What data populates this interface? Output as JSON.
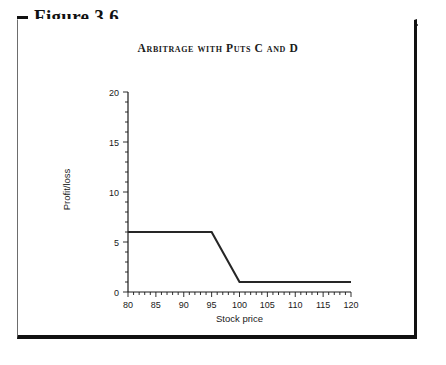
{
  "figure": {
    "bullet_icon": "black-square-bullet",
    "label": "Figure 3.6"
  },
  "chart_data": {
    "type": "line",
    "title": "Arbitrage with Puts C and D",
    "xlabel": "Stock price",
    "ylabel": "Profit/loss",
    "xlim": [
      80,
      120
    ],
    "ylim": [
      0,
      20
    ],
    "xticks": [
      80,
      85,
      90,
      95,
      100,
      105,
      110,
      115,
      120
    ],
    "xtick_labels": [
      "80",
      "85",
      "90",
      "95",
      "100",
      "105",
      "110",
      "115",
      "120"
    ],
    "yticks": [
      0,
      5,
      10,
      15,
      20
    ],
    "ytick_labels": [
      "0",
      "5",
      "10",
      "15",
      "20"
    ],
    "x_minor_step": 1,
    "y_minor_step": 1,
    "grid": false,
    "legend": null,
    "series": [
      {
        "name": "Arbitrage payoff",
        "x": [
          80,
          95,
          100,
          120
        ],
        "values": [
          6,
          6,
          1,
          1
        ]
      }
    ]
  }
}
